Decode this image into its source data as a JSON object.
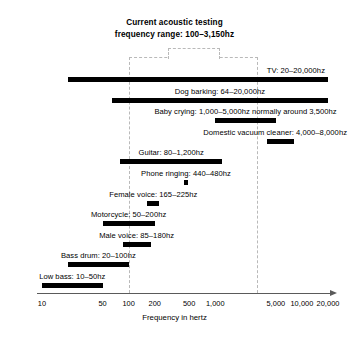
{
  "chart_data": {
    "type": "bar",
    "orientation": "horizontal",
    "title": "Current acoustic testing frequency range: 100–3,150hz",
    "title_lines": [
      "Current acoustic testing",
      "frequency range: 100–3,150hz"
    ],
    "xlabel": "Frequency in hertz",
    "ylabel": "",
    "xscale": "log",
    "xlim": [
      10,
      20000
    ],
    "grid": false,
    "legend": null,
    "tick_labels": [
      "10",
      "50",
      "100",
      "200",
      "500",
      "1,000",
      "5,000",
      "10,000",
      "20,000"
    ],
    "tick_values": [
      10,
      50,
      100,
      200,
      500,
      1000,
      5000,
      10000,
      20000
    ],
    "highlight_region": {
      "label": "Current acoustic testing frequency range",
      "from": 100,
      "to": 3150,
      "style": "dashed",
      "color": "#b9b9b9"
    },
    "categories": [
      "TV",
      "Dog barking",
      "Baby crying",
      "Domestic vacuum cleaner",
      "Guitar",
      "Phone ringing",
      "Female voice",
      "Motorcycle",
      "Male voice",
      "Bass drum",
      "Low bass"
    ],
    "bars": [
      {
        "label": "TV: 20–20,000hz",
        "name": "TV",
        "low": 20,
        "high": 20000,
        "label_align": "right",
        "label_pad": 3
      },
      {
        "label": "Dog barking: 64–20,000hz",
        "name": "Dog barking",
        "low": 64,
        "high": 20000,
        "label_align": "center",
        "label_pad": 0
      },
      {
        "label": "Baby crying: 1,000–5,000hz normally around 3,500hz",
        "name": "Baby crying",
        "low": 1000,
        "high": 5000,
        "label_align": "center",
        "label_pad": 0
      },
      {
        "label": "Domestic vacuum cleaner: 4,000–8,000hz",
        "name": "Domestic vacuum cleaner",
        "low": 4000,
        "high": 8000,
        "label_align": "center",
        "label_pad": 0
      },
      {
        "label": "Guitar: 80–1,200hz",
        "name": "Guitar",
        "low": 80,
        "high": 1200,
        "label_align": "center",
        "label_pad": 0
      },
      {
        "label": "Phone ringing: 440–480hz",
        "name": "Phone ringing",
        "low": 440,
        "high": 480,
        "label_align": "center",
        "label_pad": 0
      },
      {
        "label": "Female voice: 165–225hz",
        "name": "Female voice",
        "low": 165,
        "high": 225,
        "label_align": "center",
        "label_pad": 0
      },
      {
        "label": "Motorcycle: 50–200hz",
        "name": "Motorcycle",
        "low": 50,
        "high": 200,
        "label_align": "center",
        "label_pad": 0
      },
      {
        "label": "Male voice: 85–180hz",
        "name": "Male voice",
        "low": 85,
        "high": 180,
        "label_align": "center",
        "label_pad": 0
      },
      {
        "label": "Bass drum: 20–100hz",
        "name": "Bass drum",
        "low": 20,
        "high": 100,
        "label_align": "center",
        "label_pad": 0
      },
      {
        "label": "Low bass: 10–50hz",
        "name": "Low bass",
        "low": 10,
        "high": 50,
        "label_align": "center",
        "label_pad": 0
      }
    ],
    "values": [
      19980,
      19936,
      4000,
      4000,
      1120,
      40,
      60,
      150,
      95,
      80,
      40
    ],
    "colors": {
      "bar": "#000000",
      "axis": "#5a5a5a",
      "text": "#000000",
      "dashed_region": "#b9b9b9",
      "background": "#ffffff"
    }
  }
}
